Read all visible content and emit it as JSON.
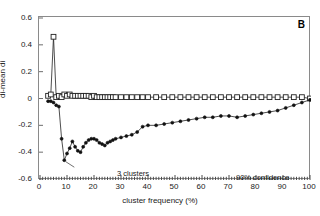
{
  "figure": {
    "panel_label": "B",
    "background": "#ffffff",
    "frame_color": "#8a8a8a"
  },
  "annotations": [
    {
      "name": "three-clusters",
      "text": "3 clusters",
      "x": 9,
      "y": -0.46
    },
    {
      "name": "ninety-confidence",
      "text": "90% confidence",
      "x": 72,
      "y": -0.48
    }
  ],
  "annotation_text": {
    "clusters": "3 clusters",
    "confidence": "90% confidence"
  },
  "chart_data": {
    "type": "line",
    "title": "",
    "subtitle": "",
    "panel": "B",
    "xlabel": "cluster frequency (%)",
    "ylabel": "di-mean di",
    "xlim": [
      0,
      100
    ],
    "ylim": [
      -0.6,
      0.6
    ],
    "xticks": [
      0,
      10,
      20,
      30,
      40,
      50,
      60,
      70,
      80,
      90,
      100
    ],
    "yticks": [
      0.6,
      0.4,
      0.2,
      0,
      -0.2,
      -0.4,
      -0.6
    ],
    "xtick_labels": [
      "0",
      "10",
      "20",
      "30",
      "40",
      "50",
      "60",
      "70",
      "80",
      "90",
      "100"
    ],
    "ytick_labels": [
      "0.6",
      "0.4",
      "0.2",
      "0",
      "-0.2",
      "-0.4",
      "-0.6"
    ],
    "minor_xticks_interval": 1,
    "grid": false,
    "legend": null,
    "legend_position": "none",
    "series": [
      {
        "name": "upper bound",
        "marker": "open-square",
        "marker_color": "#ffffff",
        "marker_edge_color": "#222222",
        "line_color": "#222222",
        "x": [
          3,
          4,
          5,
          6,
          7,
          8,
          9,
          10,
          11,
          12,
          13,
          14,
          15,
          16,
          17,
          18,
          19,
          20,
          21,
          22,
          23,
          24,
          25,
          26,
          27,
          28,
          30,
          32,
          34,
          36,
          38,
          40,
          43,
          46,
          49,
          52,
          55,
          58,
          61,
          64,
          67,
          70,
          73,
          76,
          79,
          82,
          85,
          88,
          91,
          94,
          97,
          100
        ],
        "y": [
          0.02,
          0.03,
          0.46,
          0.01,
          0.02,
          0.01,
          0.03,
          0.02,
          0.03,
          0.02,
          0.02,
          0.02,
          0.02,
          0.02,
          0.02,
          0.02,
          0.01,
          0.02,
          0.01,
          0.01,
          0.01,
          0.01,
          0.01,
          0.01,
          0.01,
          0.01,
          0.01,
          0.01,
          0.01,
          0.01,
          0.01,
          0.01,
          0.01,
          0.01,
          0.01,
          0.01,
          0.01,
          0.01,
          0.01,
          0.01,
          0.01,
          0.01,
          0.01,
          0.01,
          0.01,
          0.01,
          0.01,
          0.01,
          0.01,
          0.01,
          0.01,
          0.0
        ]
      },
      {
        "name": "lower bound",
        "marker": "filled-circle",
        "marker_color": "#111111",
        "marker_edge_color": "#111111",
        "line_color": "#222222",
        "x": [
          3,
          4,
          5,
          6,
          7,
          8,
          9,
          10,
          11,
          12,
          13,
          14,
          15,
          16,
          17,
          18,
          19,
          20,
          21,
          22,
          23,
          24,
          25,
          26,
          27,
          28,
          30,
          32,
          34,
          36,
          38,
          40,
          43,
          46,
          49,
          52,
          55,
          58,
          61,
          64,
          67,
          70,
          73,
          76,
          79,
          82,
          85,
          88,
          91,
          94,
          97,
          100
        ],
        "y": [
          -0.02,
          -0.02,
          -0.03,
          -0.05,
          -0.06,
          -0.3,
          -0.46,
          -0.41,
          -0.37,
          -0.32,
          -0.36,
          -0.39,
          -0.4,
          -0.36,
          -0.33,
          -0.31,
          -0.3,
          -0.3,
          -0.31,
          -0.33,
          -0.34,
          -0.35,
          -0.33,
          -0.32,
          -0.31,
          -0.3,
          -0.29,
          -0.28,
          -0.27,
          -0.25,
          -0.21,
          -0.2,
          -0.2,
          -0.19,
          -0.18,
          -0.17,
          -0.16,
          -0.15,
          -0.14,
          -0.14,
          -0.13,
          -0.13,
          -0.14,
          -0.13,
          -0.12,
          -0.11,
          -0.1,
          -0.09,
          -0.07,
          -0.05,
          -0.03,
          -0.01
        ]
      }
    ]
  }
}
